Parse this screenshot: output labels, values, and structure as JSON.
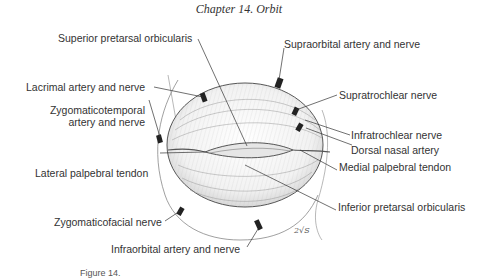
{
  "header": {
    "chapter_title": "Chapter 14.  Orbit"
  },
  "figure": {
    "labels": {
      "superior_pretarsal_orbicularis": "Superior pretarsal orbicularis",
      "lacrimal_artery_nerve": "Lacrimal artery and nerve",
      "zygomaticotemporal_line1": "Zygomaticotemporal",
      "zygomaticotemporal_line2": "artery and nerve",
      "lateral_palpebral_tendon": "Lateral palpebral tendon",
      "zygomaticofacial_nerve": "Zygomaticofacial nerve",
      "infraorbital_artery_nerve": "Infraorbital artery and nerve",
      "supraorbital_artery_nerve": "Supraorbital artery and nerve",
      "supratrochlear_nerve": "Supratrochlear nerve",
      "infratrochlear_nerve": "Infratrochlear nerve",
      "dorsal_nasal_artery": "Dorsal nasal artery",
      "medial_palpebral_tendon": "Medial palpebral tendon",
      "inferior_pretarsal_orbicularis": "Inferior pretarsal orbicularis"
    },
    "artist_signature": "2√S",
    "caption": "Figure 14."
  },
  "colors": {
    "ink": "#333333",
    "background": "#ffffff"
  }
}
